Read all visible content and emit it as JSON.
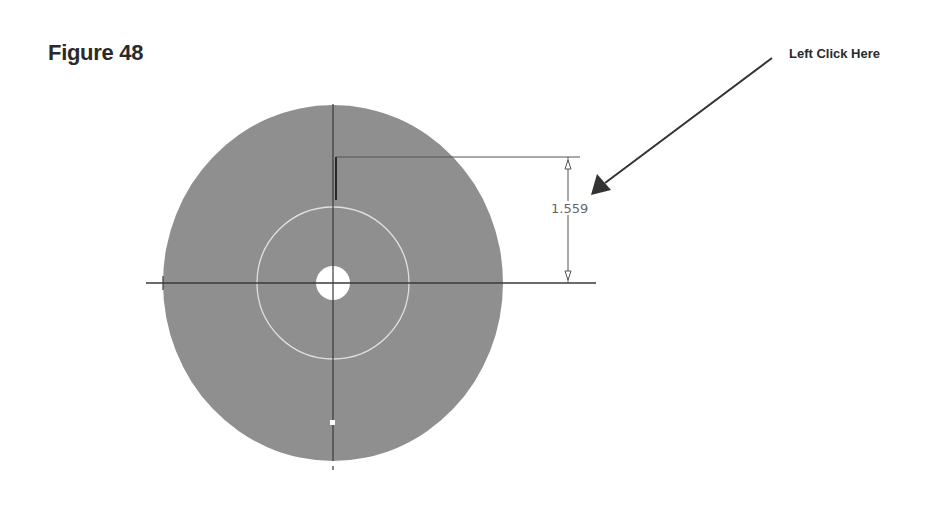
{
  "figure": {
    "title": "Figure 48",
    "callout_label": "Left Click Here"
  },
  "drawing": {
    "dimension_value": "1.559",
    "colors": {
      "part_fill": "#8f8f8f",
      "line": "#3a3a3a",
      "dimension_line": "#555555",
      "arrow": "#333333",
      "highlight": "#e8e8e8"
    }
  }
}
